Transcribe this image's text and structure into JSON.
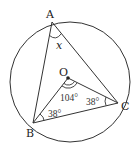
{
  "figure": {
    "type": "circle-inscribed-triangle",
    "colors": {
      "stroke": "#333333",
      "background": "#ffffff"
    },
    "points": {
      "A": {
        "label": "A"
      },
      "B": {
        "label": "B"
      },
      "C": {
        "label": "C"
      },
      "O": {
        "label": "O"
      }
    },
    "angles": {
      "BAC": {
        "label": "x"
      },
      "BOC": {
        "label": "104°"
      },
      "OBC": {
        "label": "38°"
      },
      "OCB": {
        "label": "38°"
      }
    }
  }
}
